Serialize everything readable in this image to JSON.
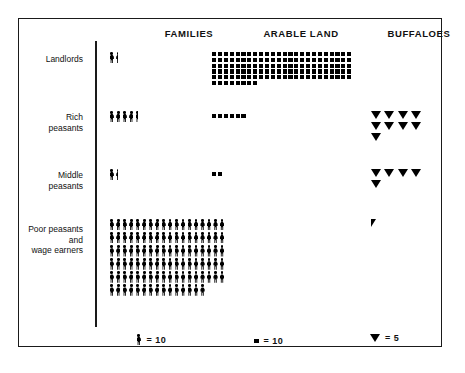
{
  "chart_data": {
    "type": "pictogram",
    "title": "",
    "columns": [
      "FAMILIES",
      "ARABLE LAND",
      "BUFFALOES"
    ],
    "categories": [
      "Landlords",
      "Rich peasants",
      "Middle peasants",
      "Poor peasants and wage earners"
    ],
    "units": {
      "families": {
        "symbol": "person",
        "value_per_symbol": 10,
        "legend": "= 10"
      },
      "arable_land": {
        "symbol": "square",
        "value_per_symbol": 10,
        "legend": "= 10"
      },
      "buffaloes": {
        "symbol": "triangle",
        "value_per_symbol": 5,
        "legend": "= 5"
      }
    },
    "series": [
      {
        "name": "Families",
        "symbols": [
          1.5,
          4.5,
          1.5,
          105
        ],
        "values": [
          15,
          45,
          15,
          1050
        ]
      },
      {
        "name": "Arable land",
        "symbols": [
          128,
          6,
          2,
          0
        ],
        "values": [
          1280,
          60,
          20,
          0
        ]
      },
      {
        "name": "Buffaloes",
        "symbols": [
          0,
          9,
          5,
          0.5
        ],
        "values": [
          0,
          45,
          25,
          2.5
        ]
      }
    ],
    "grid": false,
    "legend_position": "bottom"
  },
  "header": {
    "families": "FAMILIES",
    "arable_land": "ARABLE LAND",
    "buffaloes": "BUFFALOES"
  },
  "rows": [
    {
      "label": "Landlords",
      "families_symbols": 1.5,
      "arable_symbols": 128,
      "buffalo_symbols": 0
    },
    {
      "label": "Rich\npeasants",
      "families_symbols": 4.5,
      "arable_symbols": 6,
      "buffalo_symbols": 9
    },
    {
      "label": "Middle\npeasants",
      "families_symbols": 1.5,
      "arable_symbols": 2,
      "buffalo_symbols": 5
    },
    {
      "label": "Poor peasants\nand\nwage earners",
      "families_symbols": 105,
      "arable_symbols": 0,
      "buffalo_symbols": 0.5
    }
  ],
  "legend": {
    "families_text": "= 10",
    "arable_text": "= 10",
    "buffaloes_text": "= 5"
  },
  "colors": {
    "ink": "#000000",
    "frame": "#1a1a1a",
    "background": "#ffffff"
  }
}
